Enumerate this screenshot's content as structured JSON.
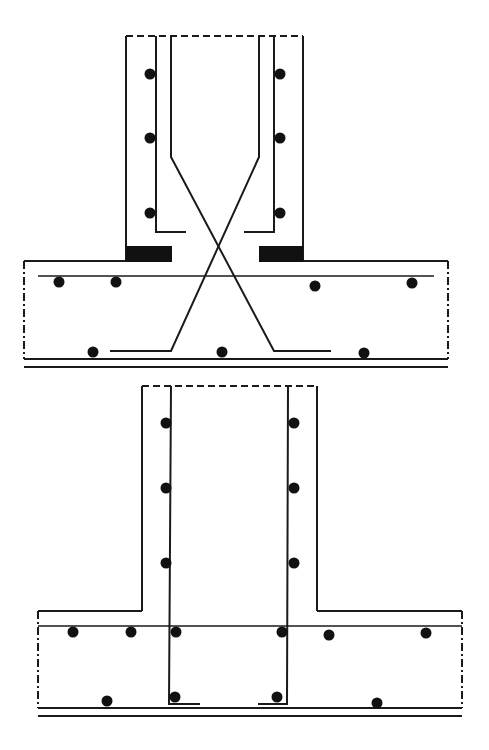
{
  "diagram": {
    "type": "reinforced-concrete-column-footing-joint-details",
    "colors": {
      "line": "#1a1a1a",
      "fill": "#111111",
      "background": "#ffffff"
    },
    "details": [
      {
        "id": "detail-top",
        "description": "Column-to-footing joint with crossed diagonal starter bars and bearing plates",
        "column": {
          "outer_left_x": 126,
          "outer_right_x": 303,
          "top_y": 36,
          "bottom_y": 261,
          "vertical_bars_x": [
            156,
            274
          ],
          "hooked_bars": [
            {
              "x_top": 171,
              "kink_y": 157,
              "hook_y": 232
            },
            {
              "x_top": 259,
              "kink_y": 157,
              "hook_y": 232
            }
          ],
          "bar_dots": [
            {
              "x": 150,
              "y": 74
            },
            {
              "x": 150,
              "y": 138
            },
            {
              "x": 150,
              "y": 213
            },
            {
              "x": 280,
              "y": 74
            },
            {
              "x": 280,
              "y": 138
            },
            {
              "x": 280,
              "y": 213
            }
          ],
          "bearing_blocks": [
            {
              "x": 126,
              "y": 246,
              "w": 46,
              "h": 16
            },
            {
              "x": 259,
              "y": 246,
              "w": 44,
              "h": 16
            }
          ]
        },
        "footing": {
          "left_x": 24,
          "right_x": 448,
          "top_y": 261,
          "bottom_y": 359,
          "top_bar": {
            "x1": 38,
            "x2": 434,
            "y": 276
          },
          "bottom_lines_y": [
            359,
            367
          ],
          "diagonal_bars": [
            {
              "points": [
                [
                  171,
                  157
                ],
                [
                  274,
                  351
                ],
                [
                  331,
                  351
                ]
              ]
            },
            {
              "points": [
                [
                  259,
                  157
                ],
                [
                  171,
                  351
                ],
                [
                  110,
                  351
                ]
              ]
            }
          ],
          "bar_dots": [
            {
              "x": 59,
              "y": 282
            },
            {
              "x": 116,
              "y": 282
            },
            {
              "x": 315,
              "y": 286
            },
            {
              "x": 412,
              "y": 283
            },
            {
              "x": 93,
              "y": 352
            },
            {
              "x": 222,
              "y": 352
            },
            {
              "x": 364,
              "y": 353
            }
          ]
        }
      },
      {
        "id": "detail-bottom",
        "description": "Column-to-footing joint with straight L-hooked starter bars",
        "column": {
          "outer_left_x": 142,
          "outer_right_x": 317,
          "top_y": 386,
          "bottom_y": 611,
          "vertical_bars_x": [
            171,
            288
          ],
          "bar_dots": [
            {
              "x": 166,
              "y": 423
            },
            {
              "x": 166,
              "y": 488
            },
            {
              "x": 166,
              "y": 563
            },
            {
              "x": 294,
              "y": 423
            },
            {
              "x": 294,
              "y": 488
            },
            {
              "x": 294,
              "y": 563
            }
          ]
        },
        "footing": {
          "left_x": 38,
          "right_x": 462,
          "top_y": 611,
          "bottom_y": 708,
          "top_bar": {
            "x1": 38,
            "x2": 462,
            "y": 626
          },
          "bottom_lines_y": [
            708,
            716
          ],
          "l_hooks": [
            {
              "x": 169,
              "bottom_y": 704,
              "to_x": 200
            },
            {
              "x": 287,
              "bottom_y": 704,
              "to_x": 258
            }
          ],
          "bar_dots": [
            {
              "x": 73,
              "y": 632
            },
            {
              "x": 131,
              "y": 632
            },
            {
              "x": 176,
              "y": 632
            },
            {
              "x": 282,
              "y": 632
            },
            {
              "x": 329,
              "y": 635
            },
            {
              "x": 426,
              "y": 633
            },
            {
              "x": 107,
              "y": 701
            },
            {
              "x": 175,
              "y": 697
            },
            {
              "x": 277,
              "y": 697
            },
            {
              "x": 377,
              "y": 703
            }
          ]
        }
      }
    ]
  }
}
